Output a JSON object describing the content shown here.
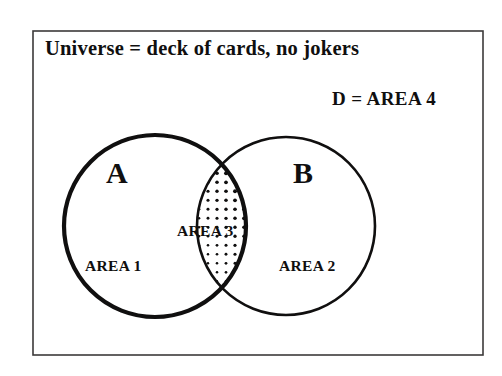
{
  "figure": {
    "kind": "venn-diagram",
    "background_color": "#ffffff",
    "ink_color": "#100f0f"
  },
  "frame": {
    "name": "universe-box",
    "stroke_color": "#3c3a3a",
    "stroke_width": 1.6,
    "x": 33,
    "y": 31,
    "width": 450,
    "height": 324
  },
  "captions": {
    "universe": "Universe = deck of cards, no jokers",
    "complement": "D = AREA 4"
  },
  "sets": [
    {
      "id": "set-a",
      "label": "A",
      "region_label": "AREA 1",
      "cx": 155,
      "cy": 226,
      "r": 91,
      "stroke_width": 4.2,
      "stroke_color": "#100f0f"
    },
    {
      "id": "set-b",
      "label": "B",
      "region_label": "AREA 2",
      "cx": 286,
      "cy": 226,
      "r": 89,
      "stroke_width": 2.6,
      "stroke_color": "#100f0f"
    }
  ],
  "intersection": {
    "id": "set-ab",
    "label": "AREA 3",
    "fill": "halftone-dot-gradient",
    "dot_color": "#100f0f",
    "dot_spacing": 9,
    "dot_min_radius": 0.6,
    "dot_max_radius": 3.0
  }
}
